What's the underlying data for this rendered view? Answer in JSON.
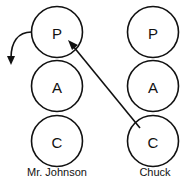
{
  "diagram": {
    "type": "transactional-analysis",
    "persons": [
      {
        "name": "Mr. Johnson",
        "states": [
          {
            "letter": "P",
            "meaning": "Parent"
          },
          {
            "letter": "A",
            "meaning": "Adult"
          },
          {
            "letter": "C",
            "meaning": "Child"
          }
        ]
      },
      {
        "name": "Chuck",
        "states": [
          {
            "letter": "P",
            "meaning": "Parent"
          },
          {
            "letter": "A",
            "meaning": "Adult"
          },
          {
            "letter": "C",
            "meaning": "Child"
          }
        ]
      }
    ],
    "arrows": [
      {
        "from": "Chuck.C",
        "to": "Mr. Johnson.P",
        "style": "straight"
      },
      {
        "from": "Mr. Johnson.P",
        "to": "outside-left",
        "style": "curved"
      }
    ]
  },
  "labels": {
    "left_person": "Mr. Johnson",
    "right_person": "Chuck",
    "left_p": "P",
    "left_a": "A",
    "left_c": "C",
    "right_p": "P",
    "right_a": "A",
    "right_c": "C"
  },
  "colors": {
    "stroke": "#111111",
    "background": "#ffffff"
  }
}
